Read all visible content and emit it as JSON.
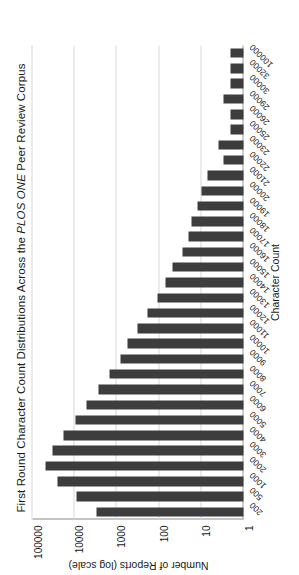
{
  "chart_data": {
    "type": "bar",
    "title": "First Round Character Count Distributions Across the PLOS ONE Peer Review Corpus",
    "title_parts": {
      "before": "First Round Character Count Distributions Across the ",
      "italic": "PLOS ONE",
      "after": " Peer Review Corpus"
    },
    "xlabel": "Character Count",
    "ylabel": "Number of Reports (log scale)",
    "yscale": "log",
    "ylim": [
      1,
      100000
    ],
    "ytick_labels": [
      "1",
      "10",
      "100",
      "1000",
      "10000",
      "100000"
    ],
    "ytick_values": [
      1,
      10,
      100,
      1000,
      10000,
      100000
    ],
    "grid": true,
    "legend": "none",
    "bar_color": "#3d3d3d",
    "orientation": "figure rotated 90 degrees counter-clockwise in frame",
    "categories": [
      "200",
      "500",
      "1000",
      "2000",
      "3000",
      "4000",
      "5000",
      "6000",
      "7000",
      "8000",
      "9000",
      "10000",
      "11000",
      "12000",
      "13000",
      "14000",
      "15000",
      "16000",
      "17000",
      "18000",
      "19000",
      "20000",
      "21000",
      "22000",
      "23000",
      "25000",
      "26000",
      "29000",
      "30000",
      "32000",
      "100000"
    ],
    "values": [
      3000,
      9000,
      25000,
      48000,
      33000,
      18000,
      9500,
      5200,
      2700,
      1500,
      820,
      560,
      330,
      190,
      110,
      70,
      48,
      28,
      20,
      17,
      12,
      10,
      7,
      3,
      4,
      2,
      2,
      3,
      2,
      2,
      2
    ],
    "series_name": "Number of Reports"
  }
}
